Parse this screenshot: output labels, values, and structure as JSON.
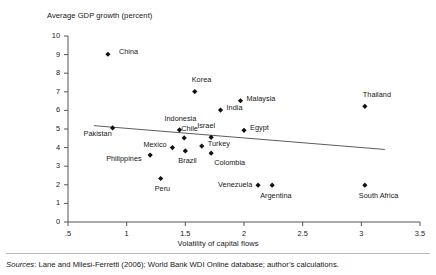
{
  "chart_data": {
    "type": "scatter",
    "title": "",
    "ylabel": "Average GDP growth (percent)",
    "xlabel": "Volatility of capital flows",
    "xlim": [
      0.5,
      3.5
    ],
    "ylim": [
      0,
      10
    ],
    "xticks": [
      ".5",
      "1",
      "1.5",
      "2",
      "2.5",
      "3",
      "3.5"
    ],
    "xtick_values": [
      0.5,
      1,
      1.5,
      2,
      2.5,
      3,
      3.5
    ],
    "yticks": [
      "0",
      "1",
      "2",
      "3",
      "4",
      "5",
      "6",
      "7",
      "8",
      "9",
      "10"
    ],
    "ytick_values": [
      0,
      1,
      2,
      3,
      4,
      5,
      6,
      7,
      8,
      9,
      10
    ],
    "grid": false,
    "legend": "none",
    "marker_color": "#111111",
    "trendline_color": "#4a4a4a",
    "axis_color": "#555555",
    "points": [
      {
        "label": "China",
        "x": 0.84,
        "y": 9.02,
        "lx": 11,
        "ly": -3
      },
      {
        "label": "Korea",
        "x": 1.58,
        "y": 7.01,
        "lx": -3,
        "ly": -13
      },
      {
        "label": "Malaysia",
        "x": 1.97,
        "y": 6.52,
        "lx": 6,
        "ly": -3
      },
      {
        "label": "Thailand",
        "x": 3.03,
        "y": 6.22,
        "lx": -2,
        "ly": -12
      },
      {
        "label": "India",
        "x": 1.8,
        "y": 6.02,
        "lx": 6,
        "ly": -3
      },
      {
        "label": "Egypt",
        "x": 2.0,
        "y": 4.93,
        "lx": 6,
        "ly": -3
      },
      {
        "label": "Indonesia",
        "x": 1.45,
        "y": 4.95,
        "lx": -15,
        "ly": -12
      },
      {
        "label": "Pakistan",
        "x": 0.88,
        "y": 5.06,
        "lx": -29,
        "ly": 5
      },
      {
        "label": "Israel",
        "x": 1.72,
        "y": 4.55,
        "lx": -14,
        "ly": -12
      },
      {
        "label": "Chile",
        "x": 1.49,
        "y": 4.52,
        "lx": -3,
        "ly": -10
      },
      {
        "label": "Turkey",
        "x": 1.64,
        "y": 4.08,
        "lx": 6,
        "ly": -3
      },
      {
        "label": "Mexico",
        "x": 1.39,
        "y": 4.0,
        "lx": -29,
        "ly": -4
      },
      {
        "label": "Brazil",
        "x": 1.5,
        "y": 3.82,
        "lx": -7,
        "ly": 9
      },
      {
        "label": "Colombia",
        "x": 1.72,
        "y": 3.7,
        "lx": 3,
        "ly": 9
      },
      {
        "label": "Philippines",
        "x": 1.2,
        "y": 3.6,
        "lx": -44,
        "ly": 3
      },
      {
        "label": "Peru",
        "x": 1.29,
        "y": 2.34,
        "lx": -6,
        "ly": 10
      },
      {
        "label": "Venezuela",
        "x": 2.12,
        "y": 1.98,
        "lx": -40,
        "ly": -1
      },
      {
        "label": "Argentina",
        "x": 2.24,
        "y": 1.98,
        "lx": -12,
        "ly": 10
      },
      {
        "label": "South Africa",
        "x": 3.03,
        "y": 1.98,
        "lx": -6,
        "ly": 10
      }
    ],
    "trendline": {
      "x1": 0.72,
      "y1": 5.18,
      "x2": 3.2,
      "y2": 3.9
    }
  },
  "notes": {
    "sources_prefix": "Sources",
    "sources_text": ": Lane and Milesi-Ferretti (2006); World Bank WDI Online database; author’s calculations."
  }
}
